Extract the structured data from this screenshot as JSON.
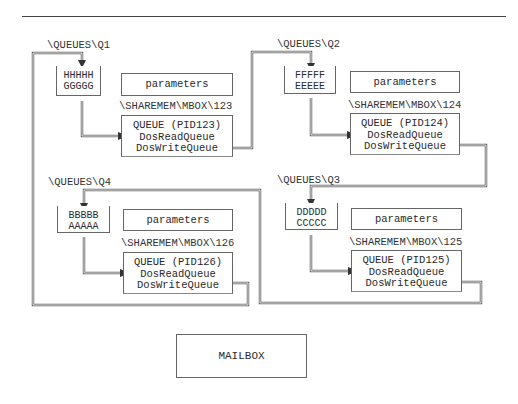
{
  "diagram": {
    "queues": [
      {
        "id": "q1",
        "path": "\\QUEUES\\Q1",
        "elements": [
          "HHHHH",
          "GGGGG"
        ],
        "parameters_label": "parameters",
        "mailbox_path": "\\SHAREMEM\\MBOX\\123",
        "queue_lines": [
          "QUEUE (PID123)",
          "DosReadQueue",
          "DosWriteQueue"
        ]
      },
      {
        "id": "q2",
        "path": "\\QUEUES\\Q2",
        "elements": [
          "FFFFF",
          "EEEEE"
        ],
        "parameters_label": "parameters",
        "mailbox_path": "\\SHAREMEM\\MBOX\\124",
        "queue_lines": [
          "QUEUE (PID124)",
          "DosReadQueue",
          "DosWriteQueue"
        ]
      },
      {
        "id": "q3",
        "path": "\\QUEUES\\Q3",
        "elements": [
          "DDDDD",
          "CCCCC"
        ],
        "parameters_label": "parameters",
        "mailbox_path": "\\SHAREMEM\\MBOX\\125",
        "queue_lines": [
          "QUEUE (PID125)",
          "DosReadQueue",
          "DosWriteQueue"
        ]
      },
      {
        "id": "q4",
        "path": "\\QUEUES\\Q4",
        "elements": [
          "BBBBB",
          "AAAAA"
        ],
        "parameters_label": "parameters",
        "mailbox_path": "\\SHAREMEM\\MBOX\\126",
        "queue_lines": [
          "QUEUE (PID126)",
          "DosReadQueue",
          "DosWriteQueue"
        ]
      }
    ],
    "legend_box": "MAILBOX",
    "colors": {
      "line": "#555555",
      "text": "#2a2a2a",
      "background": "#ffffff"
    }
  }
}
